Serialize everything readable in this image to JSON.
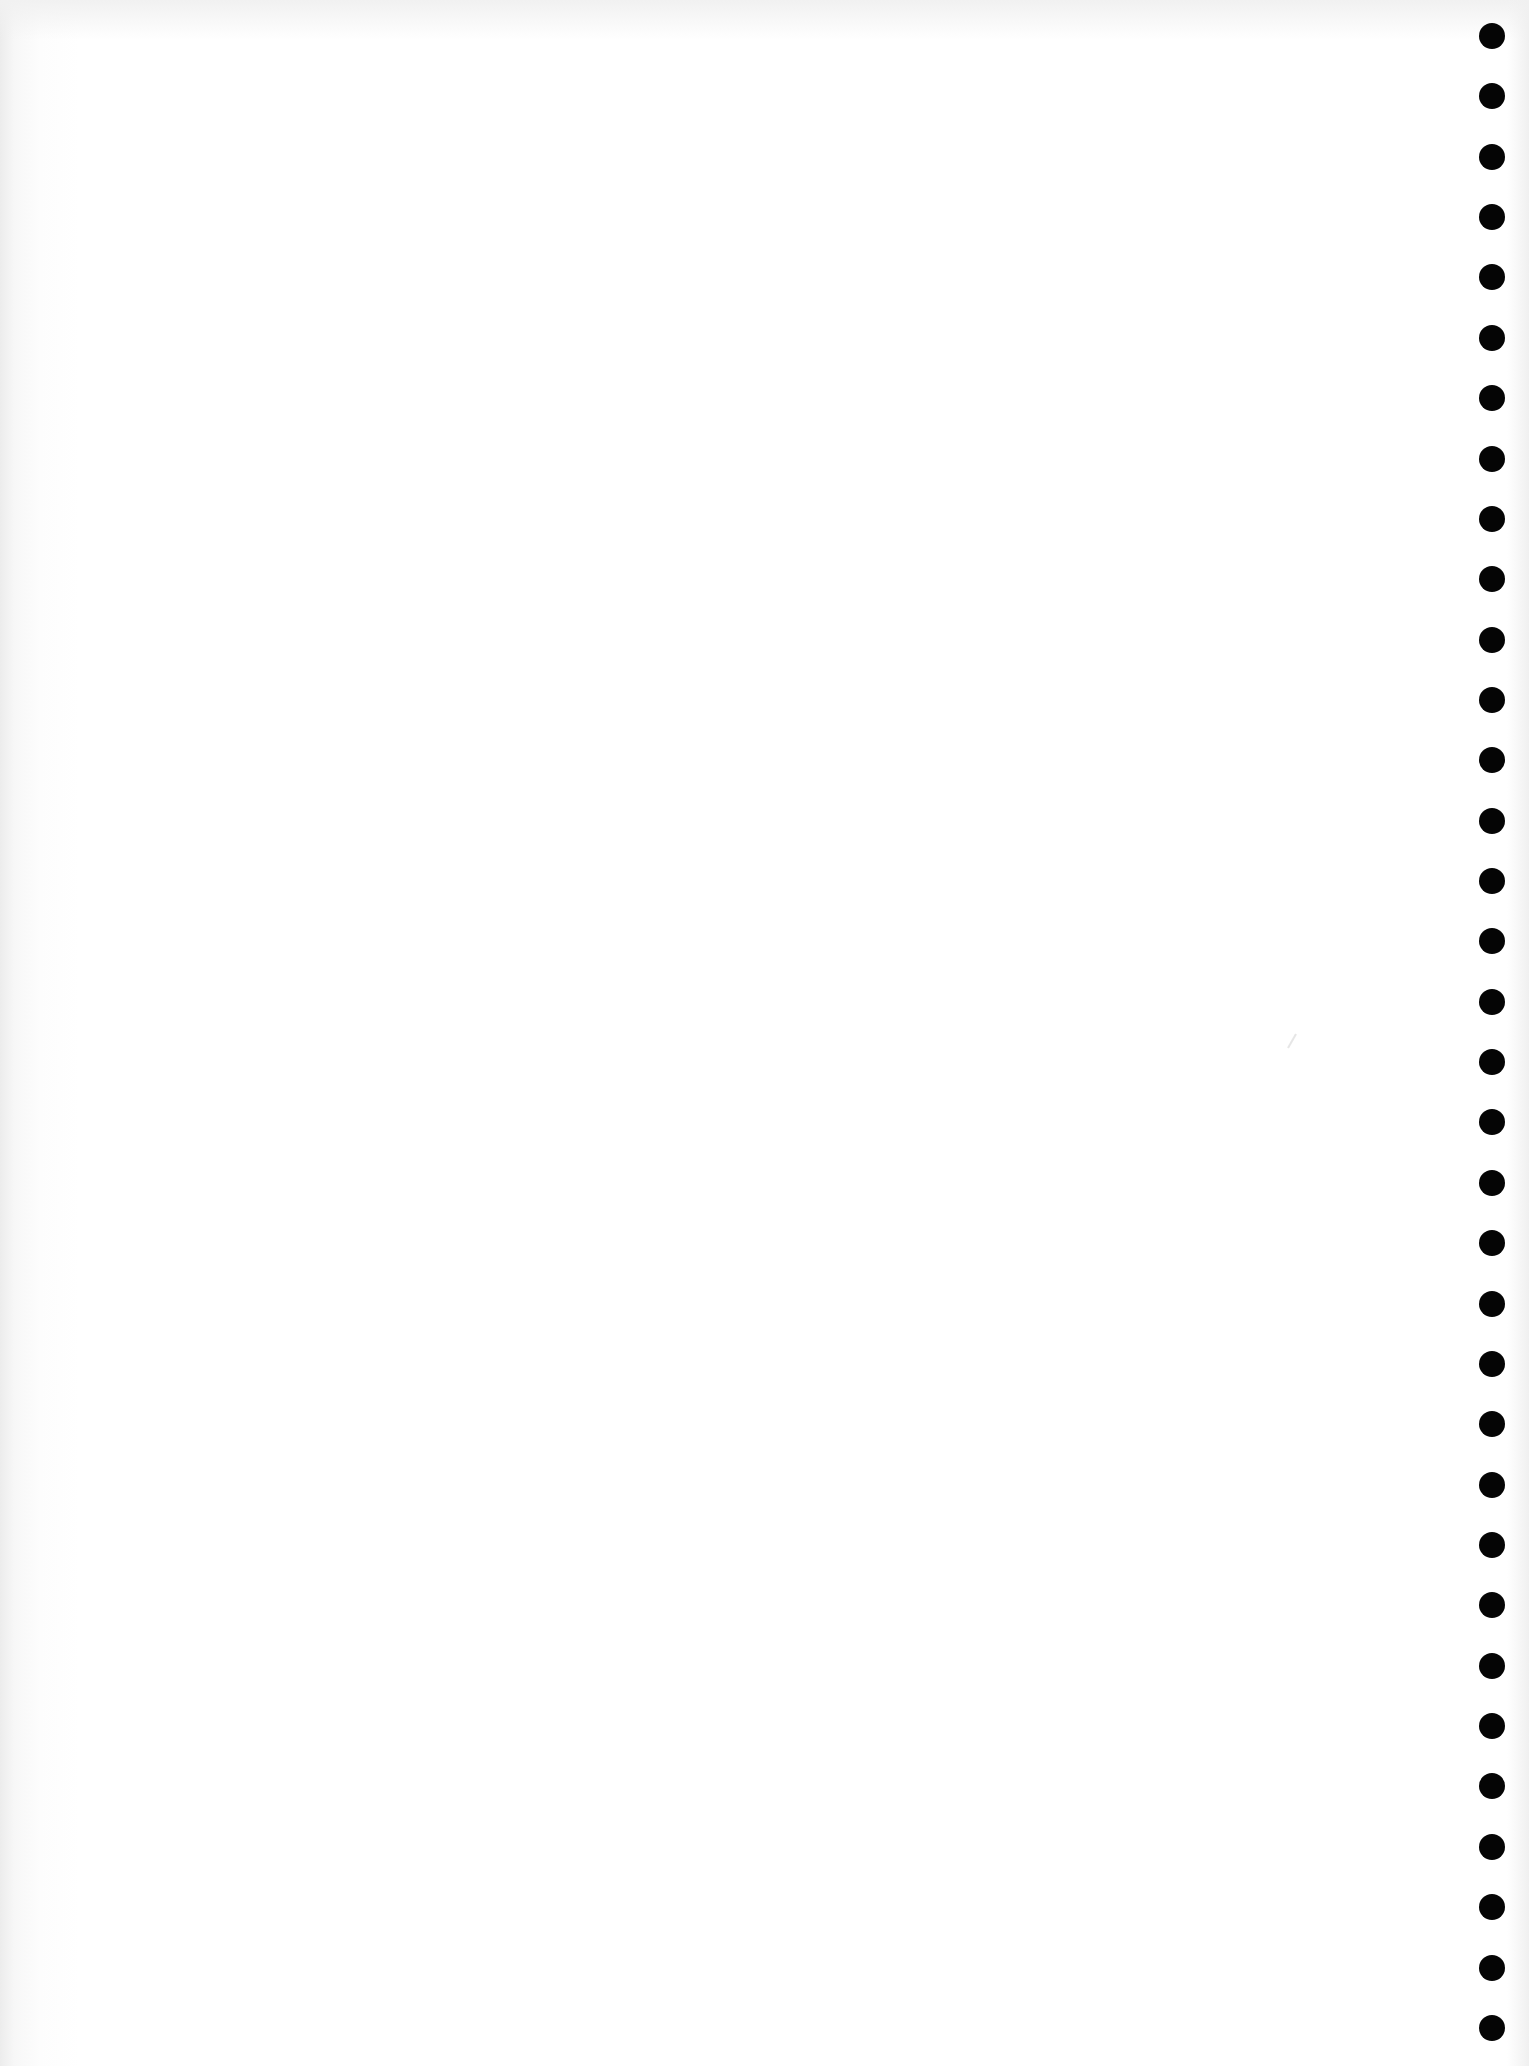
{
  "page": {
    "type": "blank-notebook-sheet",
    "content_text": "",
    "background_color": "#ffffff"
  },
  "binding": {
    "side": "right",
    "hole_count": 34,
    "hole_color": "#050505",
    "hole_diameter_px": 26,
    "first_hole_center_y": 36,
    "hole_spacing_px": 60.36
  }
}
